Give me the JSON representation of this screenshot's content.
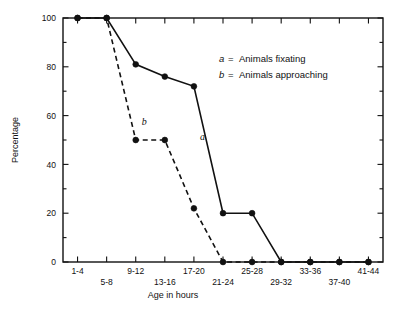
{
  "chart_data": {
    "type": "line",
    "title": "",
    "xlabel": "Age in hours",
    "ylabel": "Percentage",
    "categories": [
      "1-4",
      "5-8",
      "9-12",
      "13-16",
      "17-20",
      "21-24",
      "25-28",
      "29-32",
      "33-36",
      "37-40",
      "41-44"
    ],
    "ylim": [
      0,
      100
    ],
    "yticks": [
      0,
      20,
      40,
      60,
      80,
      100
    ],
    "yticklabels": [
      "0",
      "20",
      "40",
      "60",
      "80",
      "100"
    ],
    "yminor_step": 10,
    "grid": false,
    "legend_position": "upper-right-inside",
    "series": [
      {
        "name": "a",
        "label": "a = Animals fixating",
        "style": "solid",
        "marker": "filled-circle",
        "color": "#111111",
        "values": [
          100,
          100,
          81,
          76,
          72,
          20,
          20,
          0,
          0,
          0,
          0
        ]
      },
      {
        "name": "b",
        "label": "b = Animals approaching",
        "style": "dashed",
        "marker": "filled-circle",
        "color": "#111111",
        "values": [
          100,
          100,
          50,
          50,
          22,
          0,
          0,
          0,
          0,
          0,
          0
        ]
      }
    ],
    "annotations": [
      {
        "text": "a",
        "series": "a",
        "x_category": "17-20",
        "value": 50
      },
      {
        "text": "b",
        "series": "b",
        "x_category": "9-12",
        "value": 56
      }
    ]
  },
  "legend": {
    "entries": [
      {
        "key": "a",
        "separator": "=",
        "description": "Animals fixating"
      },
      {
        "key": "b",
        "separator": "=",
        "description": "Animals approaching"
      }
    ]
  },
  "axes": {
    "y_axis_title": "Percentage",
    "x_axis_title": "Age in hours"
  }
}
